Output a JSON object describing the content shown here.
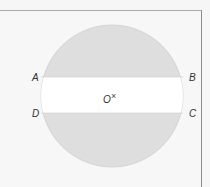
{
  "diagram": {
    "type": "circle-with-chord-band",
    "circle": {
      "cx": 112,
      "cy": 96,
      "r": 71,
      "fill": "#dedede",
      "stroke": "#cfcfcf"
    },
    "band": {
      "top_y": 77,
      "bottom_y": 113,
      "fill": "#ffffff"
    },
    "labels": {
      "A": "A",
      "B": "B",
      "C": "C",
      "D": "D",
      "O": "O",
      "center_mark": "×"
    },
    "colors": {
      "background": "#f6f6f6",
      "frame_border": "#9a9a9a",
      "shaded_segment": "#dedede",
      "band": "#ffffff",
      "label": "#333333"
    }
  }
}
